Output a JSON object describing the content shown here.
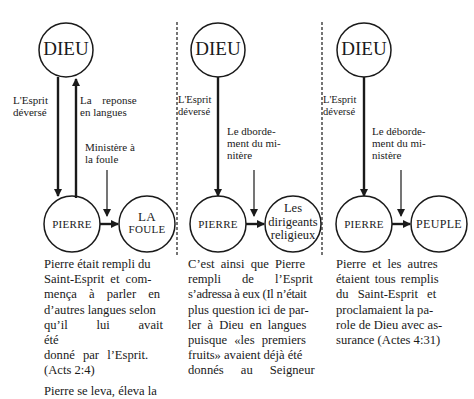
{
  "columns": [
    {
      "top_node": "DIEU",
      "bottom_left_node": "PIERRE",
      "bottom_right_node": [
        "LA",
        "FOULE"
      ],
      "arrow_labels": {
        "down": [
          "L'Esprit",
          "déversé"
        ],
        "up": [
          "La reponse",
          "en langues"
        ],
        "ministry": [
          "Ministère à",
          "la foule"
        ]
      },
      "paragraph": "Pierre était rempli du Saint-Esprit et commença à parler en d'autres langues selon qu'il lui avait été donné par l'Esprit. (Acts 2:4)",
      "paragraph_lines": [
        "Pierre était rempli du",
        "Saint-Esprit et com-",
        "mença à parler en",
        "d’autres langues selon",
        "qu’il lui avait été",
        "donné par l’Esprit.",
        "(Acts 2:4)"
      ],
      "paragraph2_partial": "Pierre se leva, éleva la"
    },
    {
      "top_node": "DIEU",
      "bottom_left_node": "PIERRE",
      "bottom_right_node": [
        "Les",
        "dirigeants",
        "religieux"
      ],
      "arrow_labels": {
        "down": [
          "L'Esprit",
          "déversé"
        ],
        "ministry": [
          "Le dborde-",
          "ment du mi-",
          "nitère"
        ]
      },
      "paragraph_lines": [
        "C’est ainsi que Pierre",
        "rempli de l’Esprit",
        "s’adressa à eux (Il n’était",
        "plus question ici de par-",
        "ler à Dieu en langues",
        "puisque «les premiers",
        "fruits» avaient déjà été",
        "donnés au Seigneur"
      ]
    },
    {
      "top_node": "DIEU",
      "bottom_left_node": "PIERRE",
      "bottom_right_node": [
        "PEUPLE"
      ],
      "arrow_labels": {
        "down": [
          "L'Esprit",
          "déversé"
        ],
        "ministry": [
          "Le déborde-",
          "ment du mi-",
          "nistère"
        ]
      },
      "paragraph_lines": [
        "Pierre et les autres",
        "étaient tous remplis",
        "du Saint-Esprit et",
        "proclamaient la pa-",
        "role de Dieu avec as-",
        "surance (Actes 4:31)"
      ]
    }
  ],
  "colors": {
    "ink": "#1a1a1a",
    "background": "#ffffff"
  }
}
